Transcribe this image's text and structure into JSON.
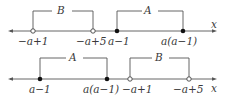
{
  "diagram": {
    "type": "number-line-intervals",
    "lines": [
      {
        "id": "top",
        "axis_label": "x",
        "points": [
          {
            "label": "−a+1",
            "style": "open"
          },
          {
            "label": "−a+5",
            "style": "open"
          },
          {
            "label": "a−1",
            "style": "filled"
          },
          {
            "label": "a(a−1)",
            "style": "filled"
          }
        ],
        "intervals": [
          {
            "name": "B",
            "from": "−a+1",
            "to": "−a+5"
          },
          {
            "name": "A",
            "from": "a−1",
            "to": "a(a−1)"
          }
        ]
      },
      {
        "id": "bottom",
        "axis_label": "x",
        "points": [
          {
            "label": "a−1",
            "style": "filled"
          },
          {
            "label": "a(a−1)",
            "style": "filled"
          },
          {
            "label": "−a+1",
            "style": "open"
          },
          {
            "label": "−a+5",
            "style": "open"
          }
        ],
        "intervals": [
          {
            "name": "A",
            "from": "a−1",
            "to": "a(a−1)"
          },
          {
            "name": "B",
            "from": "−a+1",
            "to": "−a+5"
          }
        ]
      }
    ]
  },
  "colors": {
    "line": "#555555",
    "text": "#3a3a3a",
    "background": "#ffffff"
  }
}
